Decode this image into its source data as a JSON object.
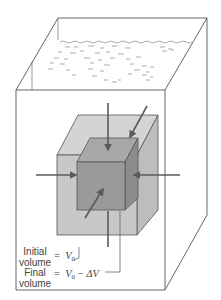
{
  "figure": {
    "colors": {
      "outline": "#555555",
      "initial_cube_fill": "#c8c8c8",
      "initial_cube_top": "#d4d4d4",
      "initial_cube_side": "#bdbdbd",
      "final_cube_front": "#9a9a9a",
      "final_cube_top": "#a8a8a8",
      "final_cube_side": "#8c8c8c",
      "arrow": "#5a5a5a",
      "water_marks": "#888888"
    },
    "labels": {
      "initial_line1": "Initial",
      "initial_line2": "volume",
      "initial_eq_sign": "=",
      "initial_symbol": "V",
      "initial_subscript": "0",
      "final_line1": "Final",
      "final_line2": "volume",
      "final_eq_sign": "=",
      "final_symbol": "V",
      "final_subscript": "0",
      "final_minus": "−",
      "final_delta": "ΔV"
    },
    "arrows": [
      {
        "name": "arrow-top",
        "direction": "down"
      },
      {
        "name": "arrow-back",
        "direction": "down-left"
      },
      {
        "name": "arrow-left",
        "direction": "right"
      },
      {
        "name": "arrow-right",
        "direction": "left"
      },
      {
        "name": "arrow-front",
        "direction": "up-right"
      },
      {
        "name": "arrow-bottom",
        "direction": "up"
      }
    ]
  }
}
